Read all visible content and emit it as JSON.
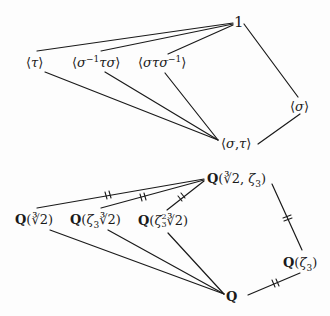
{
  "diagrams": {
    "subgroups": {
      "nodes": [
        {
          "id": "trivial",
          "label": "1"
        },
        {
          "id": "tau",
          "label": "⟨τ⟩"
        },
        {
          "id": "s_inv_t_s",
          "label": "⟨σ⁻¹τσ⟩"
        },
        {
          "id": "s_t_s_inv",
          "label": "⟨στσ⁻¹⟩"
        },
        {
          "id": "sigma",
          "label": "⟨σ⟩"
        },
        {
          "id": "sigma_tau",
          "label": "⟨σ,τ⟩"
        }
      ],
      "edges": [
        [
          "trivial",
          "tau"
        ],
        [
          "trivial",
          "s_inv_t_s"
        ],
        [
          "trivial",
          "s_t_s_inv"
        ],
        [
          "trivial",
          "sigma"
        ],
        [
          "tau",
          "sigma_tau"
        ],
        [
          "s_inv_t_s",
          "sigma_tau"
        ],
        [
          "s_t_s_inv",
          "sigma_tau"
        ],
        [
          "sigma",
          "sigma_tau"
        ]
      ]
    },
    "fields": {
      "nodes": [
        {
          "id": "splitting",
          "label": "Q(∛2, ζ₃)"
        },
        {
          "id": "cbrt2",
          "label": "Q(∛2)"
        },
        {
          "id": "z3cbrt2",
          "label": "Q(ζ₃∛2)"
        },
        {
          "id": "z3sqcbrt2",
          "label": "Q(ζ₃²∛2)"
        },
        {
          "id": "z3",
          "label": "Q(ζ₃)"
        },
        {
          "id": "Q",
          "label": "Q"
        }
      ],
      "edges": [
        {
          "from": "splitting",
          "to": "cbrt2",
          "normal": true
        },
        {
          "from": "splitting",
          "to": "z3cbrt2",
          "normal": true
        },
        {
          "from": "splitting",
          "to": "z3sqcbrt2",
          "normal": true
        },
        {
          "from": "splitting",
          "to": "z3",
          "normal": true
        },
        {
          "from": "cbrt2",
          "to": "Q",
          "normal": false
        },
        {
          "from": "z3cbrt2",
          "to": "Q",
          "normal": false
        },
        {
          "from": "z3sqcbrt2",
          "to": "Q",
          "normal": false
        },
        {
          "from": "z3",
          "to": "Q",
          "normal": true
        }
      ]
    }
  },
  "labels": {
    "one": "1",
    "tau": "τ",
    "sigma": "σ",
    "minus_one": "−1",
    "comma": ",",
    "Q": "Q",
    "zeta": "ζ",
    "three": "3",
    "two": "2",
    "langle": "⟨",
    "rangle": "⟩",
    "lparen": "(",
    "rparen": ")",
    "cbrt2": "∛2"
  }
}
